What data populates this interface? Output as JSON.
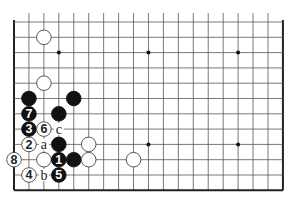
{
  "diagram": {
    "type": "go-board-fragment",
    "columns": 19,
    "rows": 12,
    "origin": {
      "x": 14,
      "y": 22
    },
    "spacing": {
      "x": 14.94,
      "y": 15.3
    },
    "edges": {
      "left": true,
      "right": true,
      "bottom": true,
      "top": false
    },
    "colors": {
      "line": "#555555",
      "edge": "#222222",
      "black_stone": "#111111",
      "white_stone": "#ffffff",
      "white_outline": "#444444",
      "black_label": "#ffffff",
      "white_label": "#222222",
      "letter": "#222222"
    },
    "star_points": [
      {
        "col": 3,
        "row": 2
      },
      {
        "col": 9,
        "row": 2
      },
      {
        "col": 15,
        "row": 2
      },
      {
        "col": 9,
        "row": 8
      },
      {
        "col": 15,
        "row": 8
      }
    ],
    "stones": [
      {
        "color": "white",
        "col": 2,
        "row": 1,
        "label": ""
      },
      {
        "color": "white",
        "col": 2,
        "row": 4,
        "label": ""
      },
      {
        "color": "black",
        "col": 1,
        "row": 5,
        "label": ""
      },
      {
        "color": "black",
        "col": 4,
        "row": 5,
        "label": ""
      },
      {
        "color": "black",
        "col": 1,
        "row": 6,
        "label": "7"
      },
      {
        "color": "black",
        "col": 3,
        "row": 6,
        "label": ""
      },
      {
        "color": "black",
        "col": 1,
        "row": 7,
        "label": "3"
      },
      {
        "color": "white",
        "col": 2,
        "row": 7,
        "label": "6"
      },
      {
        "color": "white",
        "col": 1,
        "row": 8,
        "label": "2"
      },
      {
        "color": "black",
        "col": 3,
        "row": 8,
        "label": ""
      },
      {
        "color": "white",
        "col": 5,
        "row": 8,
        "label": ""
      },
      {
        "color": "white",
        "col": 0,
        "row": 9,
        "label": "8"
      },
      {
        "color": "white",
        "col": 2,
        "row": 9,
        "label": ""
      },
      {
        "color": "black",
        "col": 3,
        "row": 9,
        "label": "1"
      },
      {
        "color": "black",
        "col": 4,
        "row": 9,
        "label": ""
      },
      {
        "color": "white",
        "col": 5,
        "row": 9,
        "label": ""
      },
      {
        "color": "white",
        "col": 8,
        "row": 9,
        "label": ""
      },
      {
        "color": "white",
        "col": 1,
        "row": 10,
        "label": "4"
      },
      {
        "color": "black",
        "col": 3,
        "row": 10,
        "label": "5"
      }
    ],
    "letters": [
      {
        "col": 3,
        "row": 7,
        "text": "c"
      },
      {
        "col": 2,
        "row": 8,
        "text": "a"
      },
      {
        "col": 2,
        "row": 10,
        "text": "b"
      }
    ]
  }
}
